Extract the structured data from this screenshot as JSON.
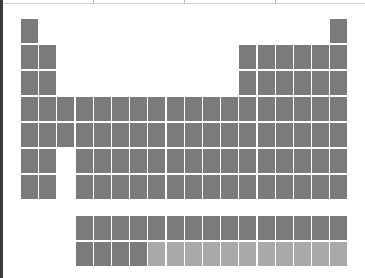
{
  "frame": {
    "top_ticks_x": [
      93,
      184,
      275
    ]
  },
  "colors": {
    "element": "#7b7b7b",
    "synthetic": "#a9a9a9",
    "background": "#ffffff"
  },
  "periodic_table": {
    "layout": {
      "col0_x": 21,
      "col_step": 18.2,
      "row0_y": 19,
      "row_step": 26,
      "cell_w": 17,
      "cell_h": 24,
      "lanthanide_y": 216,
      "actinide_y": 242
    },
    "main_rows": [
      {
        "period": 1,
        "columns": [
          1,
          18
        ]
      },
      {
        "period": 2,
        "columns": [
          1,
          2,
          13,
          14,
          15,
          16,
          17,
          18
        ]
      },
      {
        "period": 3,
        "columns": [
          1,
          2,
          13,
          14,
          15,
          16,
          17,
          18
        ]
      },
      {
        "period": 4,
        "columns": [
          1,
          2,
          3,
          4,
          5,
          6,
          7,
          8,
          9,
          10,
          11,
          12,
          13,
          14,
          15,
          16,
          17,
          18
        ]
      },
      {
        "period": 5,
        "columns": [
          1,
          2,
          3,
          4,
          5,
          6,
          7,
          8,
          9,
          10,
          11,
          12,
          13,
          14,
          15,
          16,
          17,
          18
        ]
      },
      {
        "period": 6,
        "columns": [
          1,
          2,
          4,
          5,
          6,
          7,
          8,
          9,
          10,
          11,
          12,
          13,
          14,
          15,
          16,
          17,
          18
        ]
      },
      {
        "period": 7,
        "columns": [
          1,
          2,
          4,
          5,
          6,
          7,
          8,
          9,
          10,
          11,
          12,
          13,
          14,
          15,
          16,
          17,
          18
        ]
      }
    ],
    "lanthanides": {
      "start_column": 4,
      "count": 15,
      "light_from_index": 15
    },
    "actinides": {
      "start_column": 4,
      "count": 15,
      "light_from_index": 4
    }
  }
}
